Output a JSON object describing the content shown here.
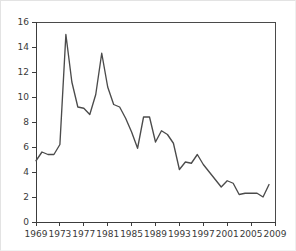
{
  "chart_data": {
    "type": "line",
    "title": "",
    "subtitle": "",
    "xlabel": "",
    "ylabel": "",
    "xlim": [
      1969,
      2009
    ],
    "ylim": [
      0,
      16
    ],
    "grid": false,
    "legend": false,
    "legend_position": "none",
    "line_color": "#4b4b4b",
    "axis_color": "#3c3c3c",
    "background_color": "#ffffff",
    "border_color": "#e3e3e3",
    "x": [
      1969,
      1970,
      1971,
      1972,
      1973,
      1974,
      1975,
      1976,
      1977,
      1978,
      1979,
      1980,
      1981,
      1982,
      1983,
      1984,
      1985,
      1986,
      1987,
      1988,
      1989,
      1990,
      1991,
      1992,
      1993,
      1994,
      1995,
      1996,
      1997,
      1998,
      1999,
      2000,
      2001,
      2002,
      2003,
      2004,
      2005,
      2006,
      2007,
      2008
    ],
    "values": [
      4.9,
      5.6,
      5.4,
      5.4,
      6.2,
      15.0,
      11.2,
      9.2,
      9.1,
      8.6,
      10.2,
      13.5,
      10.8,
      9.4,
      9.2,
      8.3,
      7.2,
      5.9,
      8.4,
      8.4,
      6.4,
      7.3,
      7.0,
      6.3,
      4.2,
      4.8,
      4.7,
      5.4,
      4.6,
      4.0,
      3.4,
      2.8,
      3.3,
      3.1,
      2.2,
      2.3,
      2.3,
      2.3,
      2.0,
      3.0
    ],
    "x_ticks": [
      1969,
      1973,
      1977,
      1981,
      1985,
      1989,
      1993,
      1997,
      2001,
      2005,
      2009
    ],
    "x_tick_labels": [
      "1969",
      "1973",
      "1977",
      "1981",
      "1985",
      "1989",
      "1993",
      "1997",
      "2001",
      "2005",
      "2009"
    ],
    "y_ticks": [
      0,
      2,
      4,
      6,
      8,
      10,
      12,
      14,
      16
    ],
    "y_tick_labels": [
      "0",
      "2",
      "4",
      "6",
      "8",
      "10",
      "12",
      "14",
      "16"
    ]
  }
}
